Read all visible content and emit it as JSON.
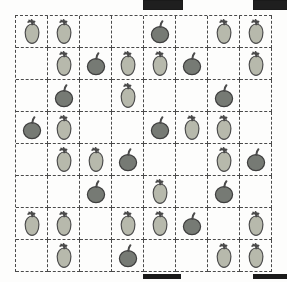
{
  "page": {
    "background_color": "#fdfdfc",
    "width": 287,
    "height": 282
  },
  "registration_marks": [
    {
      "name": "top-left-mark",
      "position": "top",
      "x": 143,
      "y": 0,
      "width": 38,
      "height": 8,
      "color": "#1f1f1f"
    },
    {
      "name": "top-right-mark",
      "position": "top",
      "x": 253,
      "y": 0,
      "width": 34,
      "height": 8,
      "color": "#1f1f1f"
    },
    {
      "name": "bottom-left-mark",
      "position": "bottom",
      "x": 143,
      "y": 274,
      "width": 38,
      "height": 5,
      "color": "#1a1a1a"
    },
    {
      "name": "bottom-right-mark",
      "position": "bottom",
      "x": 253,
      "y": 274,
      "width": 34,
      "height": 5,
      "color": "#1a1a1a"
    }
  ],
  "grid": {
    "rows": 8,
    "columns": 8,
    "cell_size": 32,
    "line_style": "dashed",
    "line_color": "#4a4a4a",
    "origin_x": 15,
    "origin_y": 15
  },
  "legend": {
    "pear_label": "pear",
    "apple_label": "apple",
    "empty_label": "empty",
    "pear_body_color": "#b7b9ac",
    "pear_outline_color": "#4d4d4d",
    "apple_body_color": "#767a74",
    "apple_outline_color": "#3f3f3f",
    "stem_color": "#4a4a4a"
  },
  "counts": {
    "pear_total": 29,
    "apple_total": 14,
    "empty_total": 21,
    "fruit_total": 43
  },
  "cells": [
    [
      "pear",
      "pear",
      "empty",
      "empty",
      "apple",
      "empty",
      "pear",
      "pear"
    ],
    [
      "empty",
      "pear",
      "apple",
      "pear",
      "pear",
      "apple",
      "empty",
      "pear"
    ],
    [
      "empty",
      "apple",
      "empty",
      "pear",
      "empty",
      "empty",
      "apple",
      "empty"
    ],
    [
      "apple",
      "pear",
      "empty",
      "empty",
      "apple",
      "pear",
      "pear",
      "empty"
    ],
    [
      "empty",
      "pear",
      "pear",
      "apple",
      "empty",
      "empty",
      "pear",
      "apple"
    ],
    [
      "empty",
      "empty",
      "apple",
      "empty",
      "pear",
      "empty",
      "apple",
      "empty"
    ],
    [
      "pear",
      "pear",
      "empty",
      "pear",
      "pear",
      "apple",
      "empty",
      "pear"
    ],
    [
      "empty",
      "pear",
      "empty",
      "apple",
      "empty",
      "empty",
      "pear",
      "pear"
    ]
  ]
}
